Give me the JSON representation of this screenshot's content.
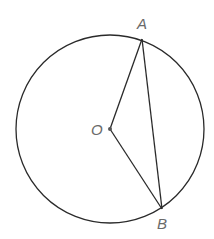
{
  "diagram": {
    "type": "circle-geometry",
    "circle": {
      "center_label": "O",
      "cx": 110,
      "cy": 129,
      "r": 94,
      "stroke": "#2a2a2a"
    },
    "points": [
      {
        "label": "A",
        "x": 142,
        "y": 39,
        "label_x": 137,
        "label_y": 29
      },
      {
        "label": "O",
        "x": 110,
        "y": 129,
        "label_x": 91,
        "label_y": 135
      },
      {
        "label": "B",
        "x": 162,
        "y": 209,
        "label_x": 157,
        "label_y": 229
      }
    ],
    "segments": [
      {
        "from": "O",
        "to": "A"
      },
      {
        "from": "A",
        "to": "B"
      },
      {
        "from": "O",
        "to": "B"
      }
    ],
    "label_color": "#6a6a6a"
  }
}
